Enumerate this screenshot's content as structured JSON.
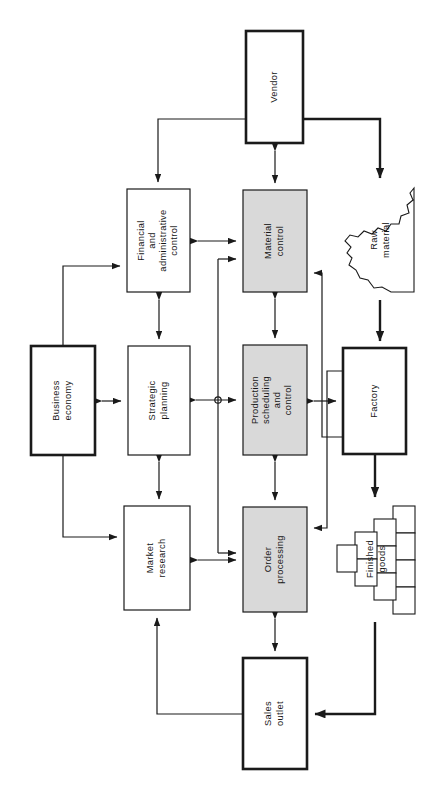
{
  "diagram": {
    "orientation": "rotated-90",
    "colors": {
      "line": "#1a1a1a",
      "shaded_fill": "#d9d9d9",
      "plain_fill": "#ffffff",
      "text": "#161616"
    },
    "nodes": [
      {
        "id": "vendor",
        "label": "Vendor",
        "shape": "rect",
        "style": "thick-outline",
        "x": 246,
        "y": 31,
        "w": 57,
        "h": 112
      },
      {
        "id": "raw",
        "label": "Raw\nmaterial",
        "shape": "heap",
        "style": "irregular",
        "x": 345,
        "y": 186,
        "w": 70,
        "h": 108
      },
      {
        "id": "financial",
        "label": "Financial\nand\nadministrative\ncontrol",
        "shape": "rect",
        "style": "thin-outline",
        "x": 127,
        "y": 189,
        "w": 63,
        "h": 103
      },
      {
        "id": "material",
        "label": "Material\ncontrol",
        "shape": "rect",
        "style": "shaded",
        "x": 243,
        "y": 190,
        "w": 64,
        "h": 102
      },
      {
        "id": "business",
        "label": "Business\neconomy",
        "shape": "rect",
        "style": "thick-outline",
        "x": 31,
        "y": 346,
        "w": 64,
        "h": 109
      },
      {
        "id": "strategic",
        "label": "Strategic\nplanning",
        "shape": "rect",
        "style": "thin-outline",
        "x": 128,
        "y": 346,
        "w": 62,
        "h": 109
      },
      {
        "id": "production",
        "label": "Production\nscheduling\nand\ncontrol",
        "shape": "rect",
        "style": "shaded",
        "x": 243,
        "y": 345,
        "w": 64,
        "h": 110
      },
      {
        "id": "factory",
        "label": "Factory",
        "shape": "rect",
        "style": "thick-outline",
        "x": 343,
        "y": 348,
        "w": 63,
        "h": 106
      },
      {
        "id": "market",
        "label": "Market\nresearch",
        "shape": "rect",
        "style": "thin-outline",
        "x": 124,
        "y": 506,
        "w": 66,
        "h": 104
      },
      {
        "id": "order",
        "label": "Order\nprocessing",
        "shape": "rect",
        "style": "shaded",
        "x": 243,
        "y": 507,
        "w": 64,
        "h": 105
      },
      {
        "id": "finished",
        "label": "Finished\ngoods",
        "shape": "stack",
        "style": "layered",
        "x": 345,
        "y": 505,
        "w": 70,
        "h": 115
      },
      {
        "id": "sales",
        "label": "Sales\noutlet",
        "shape": "rect",
        "style": "thick-outline",
        "x": 243,
        "y": 658,
        "w": 64,
        "h": 111
      }
    ],
    "node_labels": {
      "vendor": "Vendor",
      "raw_material_line1": "Raw",
      "raw_material_line2": "material",
      "financial_line1": "Financial",
      "financial_line2": "and",
      "financial_line3": "administrative",
      "financial_line4": "control",
      "material_line1": "Material",
      "material_line2": "control",
      "business_line1": "Business",
      "business_line2": "economy",
      "strategic_line1": "Strategic",
      "strategic_line2": "planning",
      "production_line1": "Production",
      "production_line2": "scheduling",
      "production_line3": "and",
      "production_line4": "control",
      "factory": "Factory",
      "market_line1": "Market",
      "market_line2": "research",
      "order_line1": "Order",
      "order_line2": "processing",
      "finished_line1": "Finished",
      "finished_line2": "goods",
      "sales_line1": "Sales",
      "sales_line2": "outlet"
    },
    "edges": [
      {
        "from": "vendor",
        "to": "material",
        "type": "double-arrow",
        "weight": "thin"
      },
      {
        "from": "vendor",
        "to": "financial",
        "type": "arrow",
        "weight": "thin"
      },
      {
        "from": "vendor",
        "to": "raw",
        "type": "arrow",
        "weight": "heavy"
      },
      {
        "from": "raw",
        "to": "factory",
        "type": "arrow",
        "weight": "heavy"
      },
      {
        "from": "financial",
        "to": "material",
        "type": "double-arrow",
        "weight": "thin"
      },
      {
        "from": "financial",
        "to": "strategic",
        "type": "double-arrow",
        "weight": "thin"
      },
      {
        "from": "business",
        "to": "financial",
        "type": "arrow",
        "weight": "thin"
      },
      {
        "from": "business",
        "to": "strategic",
        "type": "double-arrow",
        "weight": "thin"
      },
      {
        "from": "business",
        "to": "market",
        "type": "arrow",
        "weight": "thin"
      },
      {
        "from": "strategic",
        "to": "market",
        "type": "double-arrow",
        "weight": "thin"
      },
      {
        "from": "material",
        "to": "production",
        "type": "double-arrow",
        "weight": "thin"
      },
      {
        "from": "production",
        "to": "factory",
        "type": "double-arrow",
        "weight": "thin"
      },
      {
        "from": "production",
        "to": "order",
        "type": "double-arrow",
        "weight": "thin"
      },
      {
        "from": "production",
        "to": "junction",
        "type": "double-arrow",
        "weight": "thin"
      },
      {
        "from": "junction",
        "to": "material",
        "type": "arrow",
        "weight": "thin"
      },
      {
        "from": "junction",
        "to": "order",
        "type": "arrow",
        "weight": "thin"
      },
      {
        "from": "factory",
        "to": "material",
        "type": "arrow",
        "weight": "thin"
      },
      {
        "from": "factory",
        "to": "order",
        "type": "arrow",
        "weight": "thin"
      },
      {
        "from": "factory",
        "to": "finished",
        "type": "arrow",
        "weight": "heavy"
      },
      {
        "from": "market",
        "to": "order",
        "type": "double-arrow",
        "weight": "thin"
      },
      {
        "from": "order",
        "to": "sales",
        "type": "double-arrow",
        "weight": "thin"
      },
      {
        "from": "sales",
        "to": "market",
        "type": "arrow",
        "weight": "thin"
      },
      {
        "from": "finished",
        "to": "sales",
        "type": "arrow",
        "weight": "heavy"
      }
    ],
    "junction": {
      "x": 218,
      "y": 400,
      "r": 3.2
    }
  }
}
